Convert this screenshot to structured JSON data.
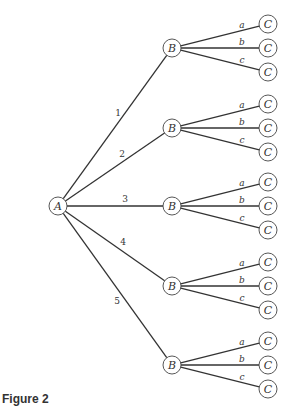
{
  "caption": "Figure 2",
  "tree": {
    "root": {
      "label": "A",
      "x": 58,
      "y": 206
    },
    "b_x": 172,
    "c_x": 268,
    "c_offsets": [
      -24,
      0,
      24
    ],
    "branches": [
      {
        "edge_label": "1",
        "b_label": "B",
        "y": 48,
        "label_pos": [
          118,
          116
        ]
      },
      {
        "edge_label": "2",
        "b_label": "B",
        "y": 128,
        "label_pos": [
          122,
          157
        ]
      },
      {
        "edge_label": "3",
        "b_label": "B",
        "y": 206,
        "label_pos": [
          125,
          202
        ]
      },
      {
        "edge_label": "4",
        "b_label": "B",
        "y": 286,
        "label_pos": [
          123,
          245
        ]
      },
      {
        "edge_label": "5",
        "b_label": "B",
        "y": 365,
        "label_pos": [
          117,
          304
        ]
      }
    ],
    "leaf_edge_labels": [
      "a",
      "b",
      "c"
    ],
    "leaf_label": "C"
  },
  "colors": {
    "line": "#333333",
    "node_stroke": "#444444",
    "background": "#ffffff"
  }
}
